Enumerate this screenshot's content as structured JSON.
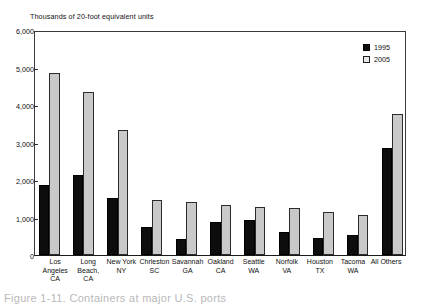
{
  "chart_data": {
    "type": "bar",
    "title": "",
    "subtitle": "",
    "ylabel": "Thousands of 20-foot equivalent units",
    "xlabel": "",
    "ylim": [
      0,
      6000
    ],
    "yticks": [
      "0",
      "1,000",
      "2,000",
      "3,000",
      "4,000",
      "5,000",
      "6,000"
    ],
    "ytick_values": [
      0,
      1000,
      2000,
      3000,
      4000,
      5000,
      6000
    ],
    "grid": false,
    "legend_position": "top-right",
    "categories": [
      "Los\nAngeles\nCA",
      "Long\nBeach,\nCA",
      "New York\nNY",
      "Chrleston\nSC",
      "Savannah\nGA",
      "Oakland\nCA",
      "Seattle\nWA",
      "Norfolk\nVA",
      "Houston\nTX",
      "Tacoma\nWA",
      "All Others"
    ],
    "series": [
      {
        "name": "1995",
        "color": "#0d0d0d",
        "values": [
          1870,
          2140,
          1530,
          750,
          430,
          890,
          950,
          620,
          460,
          550,
          2880
        ]
      },
      {
        "name": "2005",
        "color": "#c9c9c9",
        "values": [
          4880,
          4370,
          3350,
          1490,
          1430,
          1340,
          1290,
          1260,
          1160,
          1090,
          3780
        ]
      }
    ]
  },
  "caption": {
    "text": "Figure 1-11.  Containers at major U.S. ports"
  }
}
